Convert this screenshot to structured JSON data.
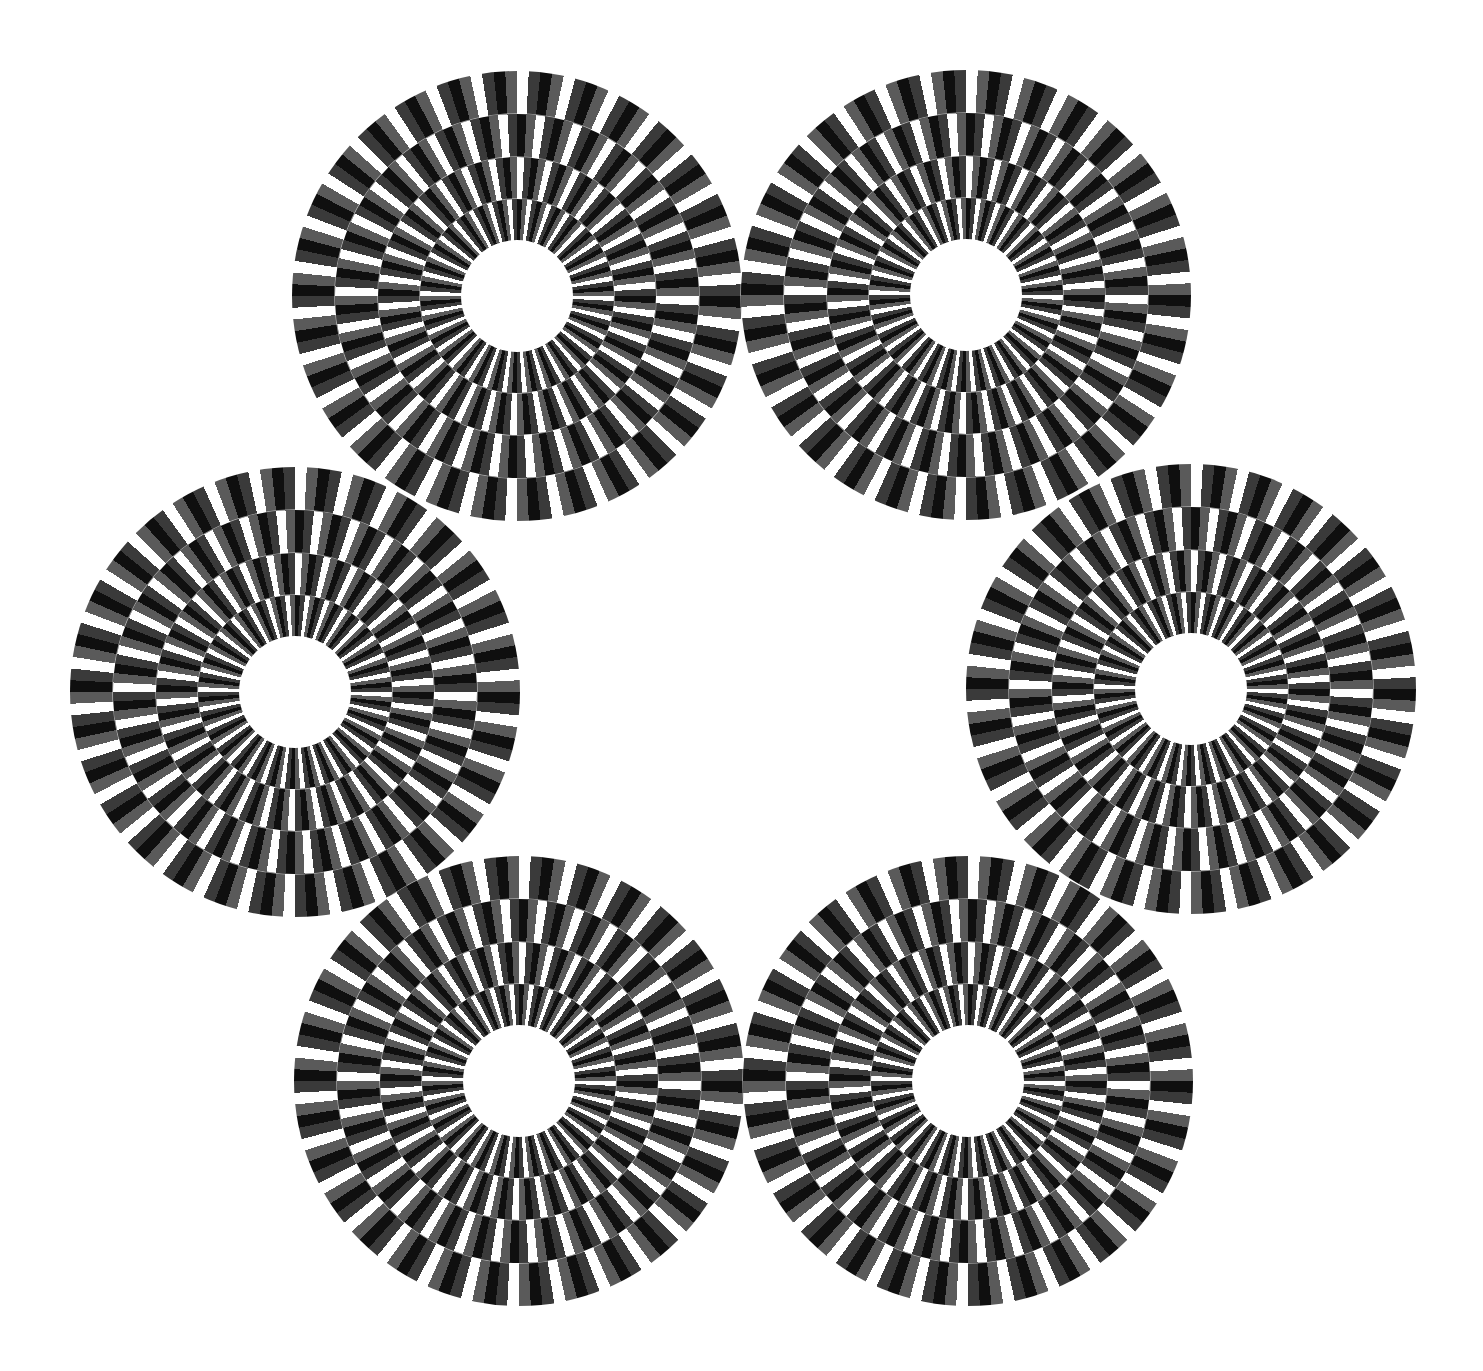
{
  "illusion": {
    "type": "rotating-rings-optical-illusion",
    "background_color": "#ffffff",
    "stripe_colors": [
      "#ffffff",
      "#3a3a3a",
      "#0f0f0f",
      "#5a5a5a"
    ],
    "periods_per_ring": 30,
    "ring_radii": [
      225,
      182,
      139,
      97
    ],
    "hole_radius": 56,
    "ring_offset_degrees": 6,
    "discs": [
      {
        "name": "top-left",
        "cx": 517,
        "cy": 296,
        "direction": 1
      },
      {
        "name": "top-right",
        "cx": 966,
        "cy": 295,
        "direction": -1
      },
      {
        "name": "middle-left",
        "cx": 295,
        "cy": 692,
        "direction": -1
      },
      {
        "name": "middle-right",
        "cx": 1191,
        "cy": 689,
        "direction": 1
      },
      {
        "name": "bottom-left",
        "cx": 519,
        "cy": 1081,
        "direction": 1
      },
      {
        "name": "bottom-right",
        "cx": 968,
        "cy": 1081,
        "direction": -1
      }
    ]
  }
}
